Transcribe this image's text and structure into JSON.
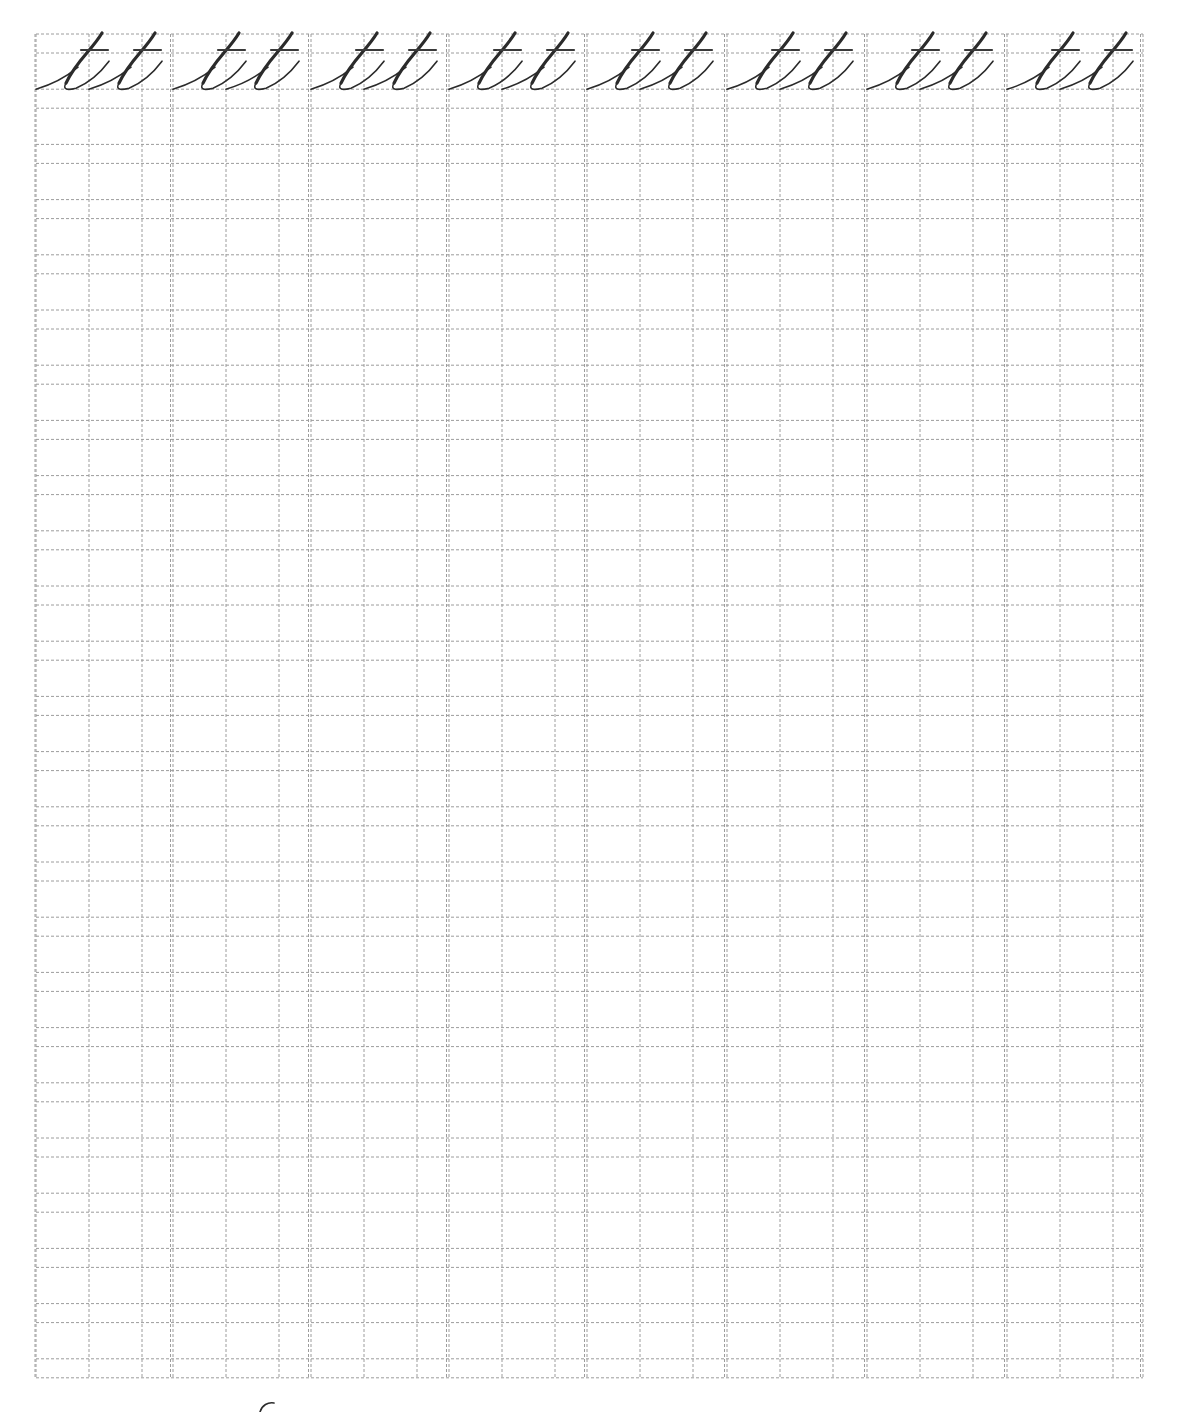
{
  "worksheet": {
    "title": "Cursive letter t practice sheet",
    "practice_letter": "t",
    "letters_per_block": 2,
    "block_count": 8,
    "row_count": 25,
    "model_row_text": [
      "tt",
      "tt",
      "tt",
      "tt",
      "tt",
      "tt",
      "tt",
      "tt"
    ],
    "colors": {
      "grid_line": "#9c9c9c",
      "ink": "#2b2b2b",
      "background": "#ffffff"
    },
    "layout": {
      "left": 36,
      "top": 34,
      "right": 1143,
      "bottom": 1379,
      "row_pitch": 55.2,
      "ascender_gap": 19,
      "block_starts": [
        36,
        173,
        311,
        449,
        587,
        727,
        867,
        1007
      ],
      "block_sub_offsets": [
        53,
        106
      ],
      "double_line_gap": 2.5
    },
    "cutoff_mark": {
      "description": "partial stroke from next page",
      "x": 262,
      "y": 1403
    }
  }
}
